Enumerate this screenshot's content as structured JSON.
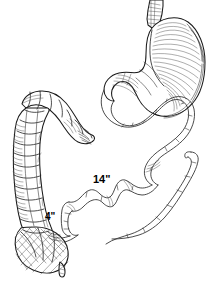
{
  "figure": {
    "background_color": "#ffffff",
    "ink_color": "#1a1a1a",
    "width": 215,
    "height": 284,
    "style": "pen-and-ink medical illustration with cross-hatch shading"
  },
  "labels": {
    "small_bowel_length": "14\"",
    "short_segment_length": "4\""
  },
  "structures": [
    {
      "name": "esophagus",
      "description": "tubular segment entering stomach at top right"
    },
    {
      "name": "stomach",
      "description": "J-shaped organ, upper right, with fundus, body, greater curvature and pylorus, rendered with dense cross-hatch shading"
    },
    {
      "name": "duodenum-jejunum",
      "description": "long serpentine small bowel loops descending from pylorus through center of figure"
    },
    {
      "name": "colon",
      "description": "haustrated large bowel at left, descending vertically with segmented pouches"
    },
    {
      "name": "cecum",
      "description": "rounded sac at bottom left of colon with cross-hatch shading"
    },
    {
      "name": "appendix",
      "description": "small tapered projection from inferior cecum"
    },
    {
      "name": "bypassed-limb",
      "description": "separate blind-ending bowel limb at lower right"
    },
    {
      "name": "anastomosis",
      "description": "junction where small bowel joins colon near cecum"
    }
  ]
}
